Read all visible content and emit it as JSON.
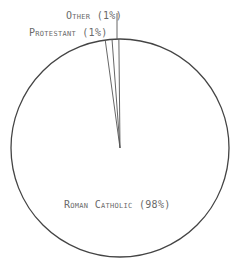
{
  "chart_data": {
    "type": "pie",
    "title": "",
    "categories": [
      "Roman Catholic",
      "Protestant",
      "Other"
    ],
    "values": [
      98,
      1,
      1
    ],
    "labels": [
      "Roman Catholic (98%)",
      "Protestant (1%)",
      "Other (1%)"
    ],
    "legend": "none (direct labels)",
    "grid": false
  },
  "labels": {
    "roman_catholic": "Roman Catholic (98%)",
    "protestant": "Protestant (1%)",
    "other": "Other (1%)"
  },
  "colors": {
    "outline": "#444444",
    "text": "#6a6a6a",
    "fill": "#ffffff"
  },
  "geometry": {
    "cx": 120,
    "cy": 148,
    "r": 109
  }
}
